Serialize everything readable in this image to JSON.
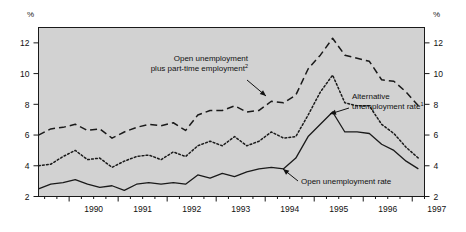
{
  "chart_data": {
    "type": "line",
    "title": "",
    "subtitle": "",
    "xlabel": "",
    "ylabel": "%",
    "y_unit_label": "%",
    "ylim": [
      2,
      13
    ],
    "yticks": [
      2,
      4,
      6,
      8,
      10,
      12
    ],
    "ytick_labels": [
      "2",
      "4",
      "6",
      "8",
      "10",
      "12"
    ],
    "xlim": [
      1989.375,
      1997.25
    ],
    "xtick_labels": [
      "1990",
      "1991",
      "1992",
      "1993",
      "1994",
      "1995",
      "1996",
      "1997"
    ],
    "xtick_years": [
      1990,
      1991,
      1992,
      1993,
      1994,
      1995,
      1996,
      1997
    ],
    "minor_tick_interval_quarters": 1,
    "grid": false,
    "legend": "annotations",
    "plot_background": "#d2d2d2",
    "line_color": "#1a1a1a",
    "x": [
      1989.375,
      1989.625,
      1989.875,
      1990.125,
      1990.375,
      1990.625,
      1990.875,
      1991.125,
      1991.375,
      1991.625,
      1991.875,
      1992.125,
      1992.375,
      1992.625,
      1992.875,
      1993.125,
      1993.375,
      1993.625,
      1993.875,
      1994.125,
      1994.375,
      1994.625,
      1994.875,
      1995.125,
      1995.375,
      1995.625,
      1995.875,
      1996.125,
      1996.375,
      1996.625,
      1996.875,
      1997.125
    ],
    "series": [
      {
        "name": "Open unemployment plus part-time employment",
        "label": "Open unemployment\nplus part-time employment",
        "footnote": "2",
        "style": "dashed",
        "values": [
          6.0,
          6.4,
          6.5,
          6.7,
          6.3,
          6.4,
          5.8,
          6.2,
          6.5,
          6.7,
          6.6,
          6.8,
          6.3,
          7.3,
          7.6,
          7.6,
          7.9,
          7.5,
          7.6,
          8.2,
          8.1,
          8.6,
          10.3,
          11.2,
          12.3,
          11.2,
          11.0,
          10.8,
          9.6,
          9.5,
          8.8,
          7.9
        ]
      },
      {
        "name": "Alternative unemployment rate",
        "label": "Alternative\nunemployment rate",
        "footnote": "1",
        "style": "dotted",
        "values": [
          4.0,
          4.1,
          4.6,
          5.0,
          4.4,
          4.5,
          3.9,
          4.3,
          4.6,
          4.7,
          4.4,
          4.9,
          4.6,
          5.3,
          5.6,
          5.3,
          5.9,
          5.3,
          5.6,
          6.2,
          5.8,
          5.9,
          7.3,
          8.8,
          9.9,
          8.1,
          7.9,
          7.9,
          6.7,
          6.1,
          5.2,
          4.5
        ]
      },
      {
        "name": "Open unemployment rate",
        "label": "Open unemployment rate",
        "footnote": "",
        "style": "solid",
        "values": [
          2.5,
          2.8,
          2.9,
          3.1,
          2.8,
          2.6,
          2.7,
          2.4,
          2.8,
          2.9,
          2.8,
          2.9,
          2.8,
          3.4,
          3.2,
          3.5,
          3.3,
          3.6,
          3.8,
          3.9,
          3.8,
          4.5,
          5.9,
          6.7,
          7.5,
          6.2,
          6.2,
          6.1,
          5.4,
          5.0,
          4.3,
          3.8
        ]
      }
    ],
    "annotations": [
      {
        "name": "annotation-open-plus-parttime",
        "lines": [
          "Open unemployment",
          "plus part-time employment"
        ],
        "footnote": "2",
        "x": 248,
        "y": 61,
        "align": "end",
        "arrow_from": [
          247,
          80
        ],
        "arrow_to": [
          266,
          96
        ]
      },
      {
        "name": "annotation-alternative-rate",
        "lines": [
          "Alternative",
          "unemployment rate"
        ],
        "footnote": "1",
        "x": 352,
        "y": 99,
        "align": "start",
        "arrow_from": [
          349,
          108
        ],
        "arrow_to": [
          330,
          114
        ]
      },
      {
        "name": "annotation-open-rate",
        "lines": [
          "Open unemployment rate"
        ],
        "footnote": "",
        "x": 301,
        "y": 184,
        "align": "start",
        "arrow_from": [
          298,
          181
        ],
        "arrow_to": [
          283,
          169
        ]
      }
    ]
  }
}
